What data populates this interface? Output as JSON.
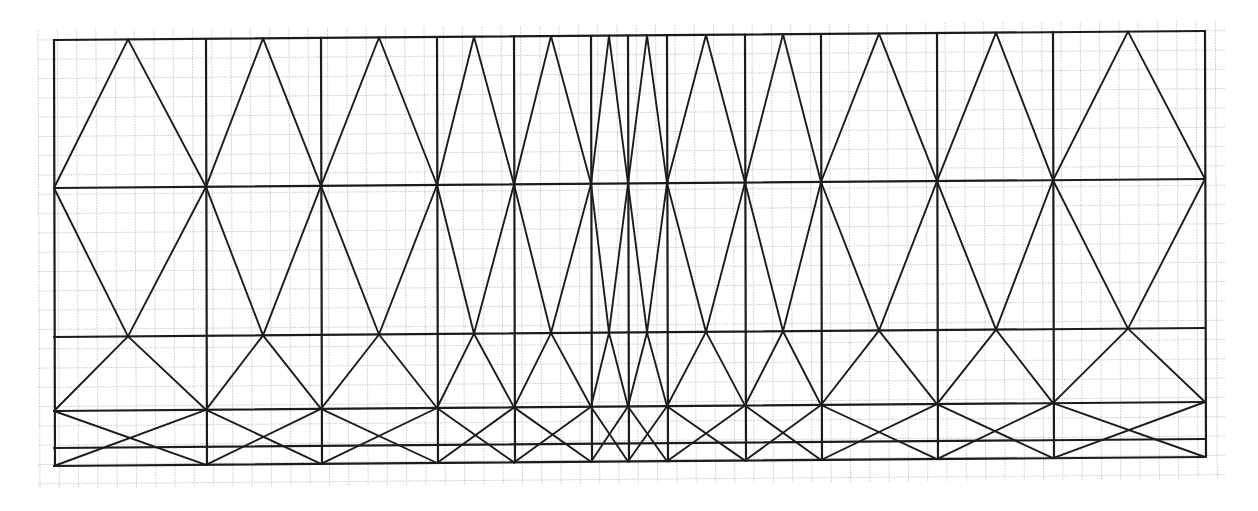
{
  "diagram": {
    "title": "",
    "colors": {
      "paper": "#ffffff",
      "grid": "#bdbdbd",
      "ink": "#1c1c1c"
    },
    "paper": {
      "x0": 38,
      "y0": 30,
      "x1": 1225,
      "y1": 488,
      "grid_step": 19.3
    },
    "tilt_per_px": -0.0078,
    "columns_x": [
      54,
      206,
      321,
      437,
      514,
      591,
      628,
      667,
      745,
      821,
      937,
      1053,
      1205
    ],
    "peaks_x": [
      128,
      263,
      379,
      474,
      551,
      609,
      647,
      706,
      783,
      879,
      996,
      1128
    ],
    "rows_y_left": {
      "top": 40,
      "mid1": 188,
      "mid2": 337,
      "mid3": 411,
      "mid4": 448,
      "bottom": 466
    },
    "row_names": [
      "top",
      "mid1",
      "mid2",
      "mid3",
      "mid4",
      "bottom"
    ]
  }
}
